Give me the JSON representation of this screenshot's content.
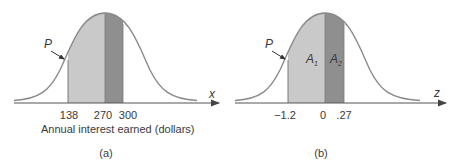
{
  "colors": {
    "curve": "#8a8a8a",
    "axis": "#555555",
    "light_fill": "#c9c9c9",
    "dark_fill": "#8f8f8f",
    "text": "#3a3a3a"
  },
  "panels": [
    {
      "id": "a",
      "caption": "(a)",
      "axis_variable": "x",
      "axis_title": "Annual interest earned (dollars)",
      "pointer_label": "P",
      "ticks": [
        "138",
        "270",
        "300"
      ],
      "regions": [
        {
          "from": "138",
          "to": "270",
          "shade": "light"
        },
        {
          "from": "270",
          "to": "300",
          "shade": "dark"
        }
      ]
    },
    {
      "id": "b",
      "caption": "(b)",
      "axis_variable": "z",
      "pointer_label": "P",
      "ticks": [
        "−1.2",
        "0",
        ".27"
      ],
      "area_labels": [
        {
          "main": "A",
          "sub": "1"
        },
        {
          "main": "A",
          "sub": "2"
        }
      ],
      "regions": [
        {
          "from": "-1.2",
          "to": "0",
          "shade": "light",
          "label": "A1"
        },
        {
          "from": "0",
          "to": ".27",
          "shade": "dark",
          "label": "A2"
        }
      ]
    }
  ]
}
